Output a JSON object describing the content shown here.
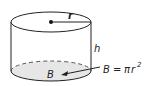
{
  "diagram": {
    "labels": {
      "radius": "r",
      "height": "h",
      "base": "B",
      "formula_lhs": "B",
      "formula_eq": "=",
      "formula_pi": "π",
      "formula_r": "r",
      "formula_exp": "2"
    },
    "colors": {
      "stroke": "#222222",
      "base_fill": "#e6e6e6"
    }
  }
}
